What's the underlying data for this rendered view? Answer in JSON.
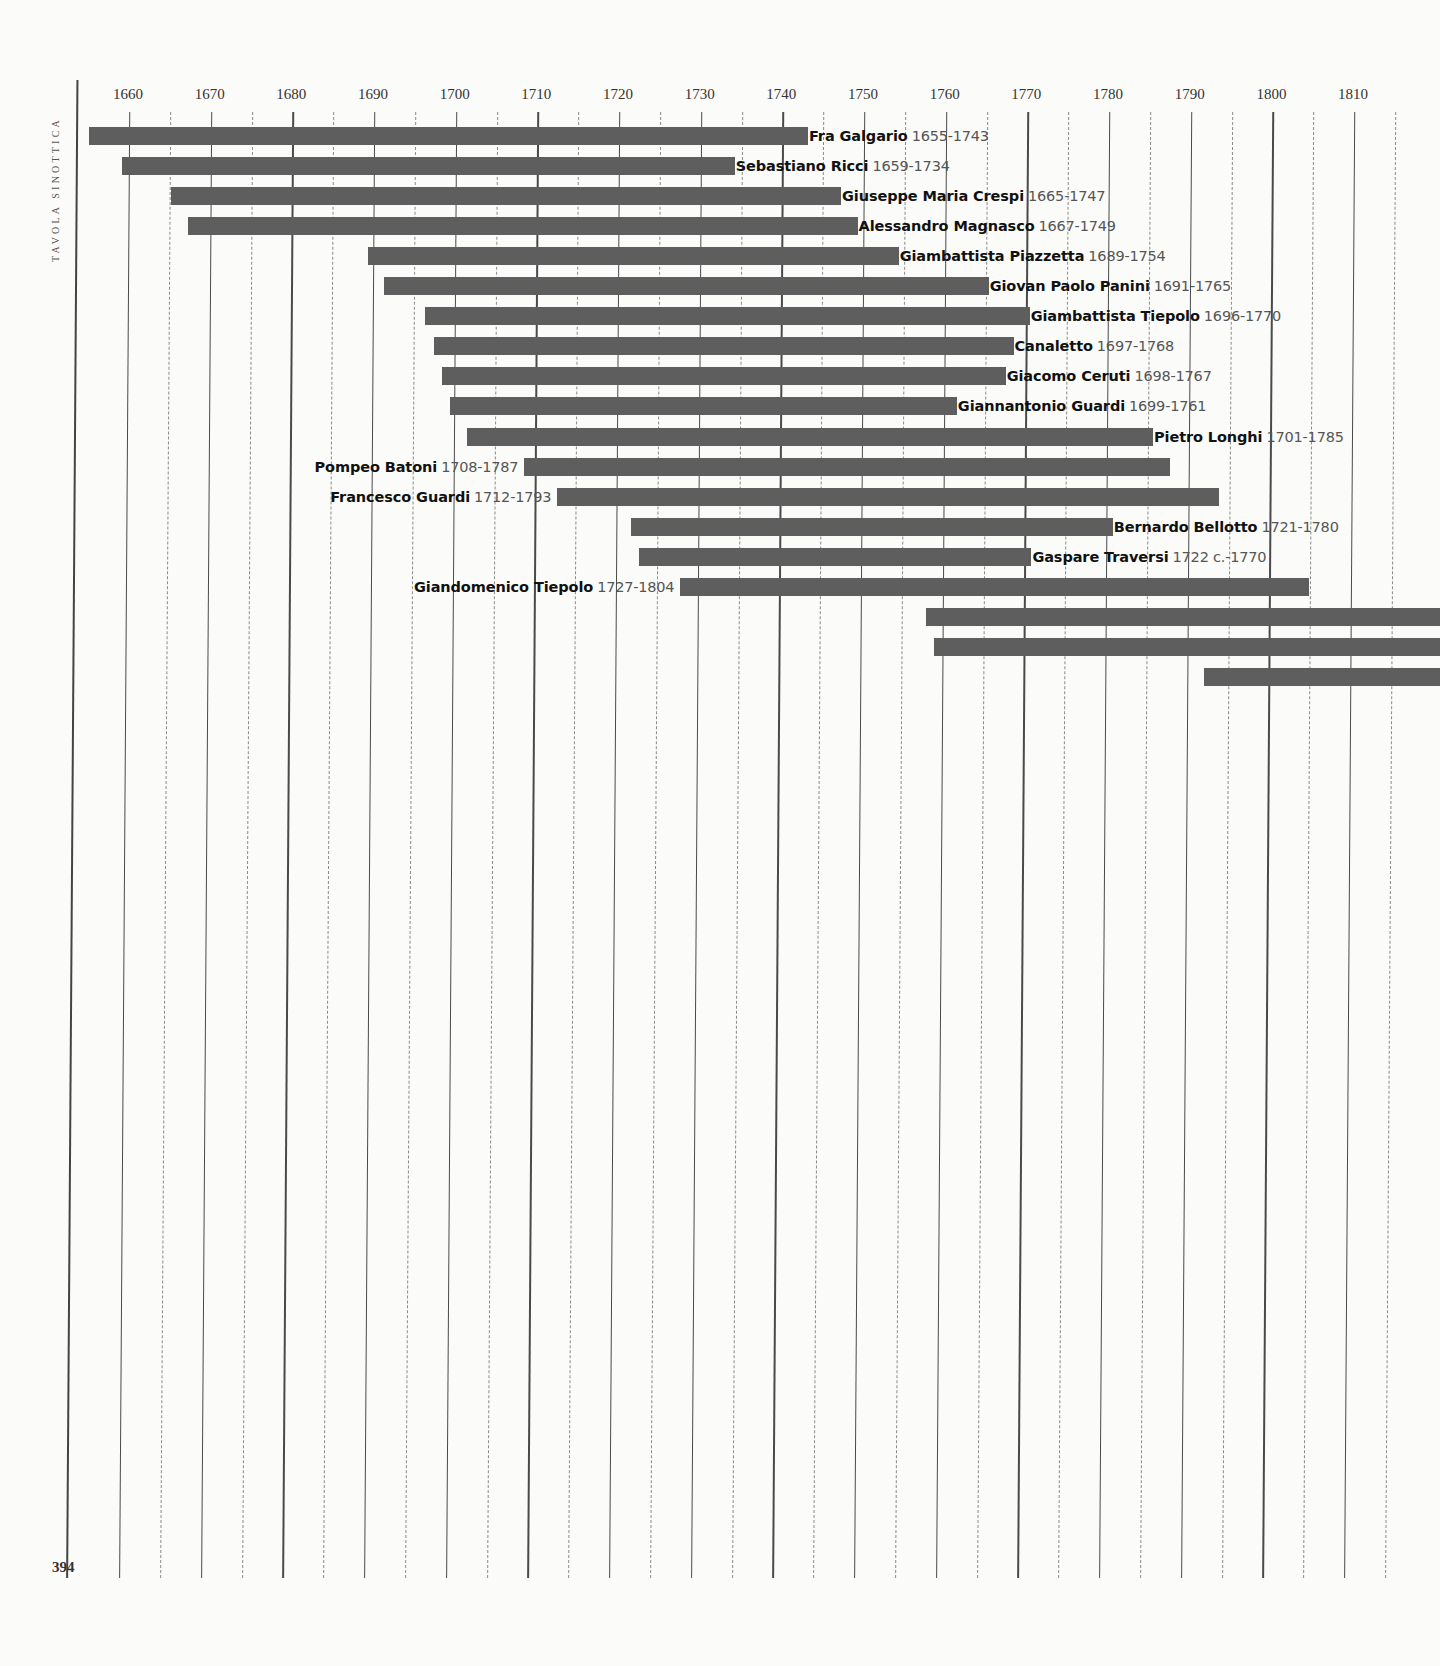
{
  "page": {
    "side_title": "Tavola sinottica",
    "page_number": "394"
  },
  "colors": {
    "bar": "#5e5e5e",
    "grid_solid": "#4a4a4a",
    "grid_dashed": "#8a8a8a",
    "background": "#fbfbf9"
  },
  "axis": {
    "ticks": [
      "1660",
      "1670",
      "1680",
      "1690",
      "1700",
      "1710",
      "1720",
      "1730",
      "1740",
      "1750",
      "1760",
      "1770",
      "1780",
      "1790",
      "1800",
      "1810"
    ]
  },
  "chart_data": {
    "type": "bar",
    "orientation": "horizontal-timeline",
    "title": "Tavola sinottica",
    "xlabel": "",
    "ylabel": "",
    "xlim": [
      1650,
      1818
    ],
    "grid": "solid lines every 10 years, dashed lines at mid-decades",
    "x_ticks": [
      1660,
      1670,
      1680,
      1690,
      1700,
      1710,
      1720,
      1730,
      1740,
      1750,
      1760,
      1770,
      1780,
      1790,
      1800,
      1810
    ],
    "series": [
      {
        "name": "Fra Galgario",
        "years_label": "1655-1743",
        "start": 1655,
        "end": 1743,
        "label_side": "right"
      },
      {
        "name": "Sebastiano Ricci",
        "years_label": "1659-1734",
        "start": 1659,
        "end": 1734,
        "label_side": "right"
      },
      {
        "name": "Giuseppe Maria Crespi",
        "years_label": "1665-1747",
        "start": 1665,
        "end": 1747,
        "label_side": "right"
      },
      {
        "name": "Alessandro Magnasco",
        "years_label": "1667-1749",
        "start": 1667,
        "end": 1749,
        "label_side": "right"
      },
      {
        "name": "Giambattista Piazzetta",
        "years_label": "1689-1754",
        "start": 1689,
        "end": 1754,
        "label_side": "right"
      },
      {
        "name": "Giovan Paolo Panini",
        "years_label": "1691-1765",
        "start": 1691,
        "end": 1765,
        "label_side": "right"
      },
      {
        "name": "Giambattista Tiepolo",
        "years_label": "1696-1770",
        "start": 1696,
        "end": 1770,
        "label_side": "right"
      },
      {
        "name": "Canaletto",
        "years_label": "1697-1768",
        "start": 1697,
        "end": 1768,
        "label_side": "right"
      },
      {
        "name": "Giacomo Ceruti",
        "years_label": "1698-1767",
        "start": 1698,
        "end": 1767,
        "label_side": "right"
      },
      {
        "name": "Giannantonio Guardi",
        "years_label": "1699-1761",
        "start": 1699,
        "end": 1761,
        "label_side": "right"
      },
      {
        "name": "Pietro Longhi",
        "years_label": "1701-1785",
        "start": 1701,
        "end": 1785,
        "label_side": "right"
      },
      {
        "name": "Pompeo Batoni",
        "years_label": "1708-1787",
        "start": 1708,
        "end": 1787,
        "label_side": "left"
      },
      {
        "name": "Francesco Guardi",
        "years_label": "1712-1793",
        "start": 1712,
        "end": 1793,
        "label_side": "left"
      },
      {
        "name": "Bernardo Bellotto",
        "years_label": "1721-1780",
        "start": 1721,
        "end": 1780,
        "label_side": "right"
      },
      {
        "name": "Gaspare Traversi",
        "years_label": "1722 c.-1770",
        "start": 1722,
        "end": 1770,
        "label_side": "right"
      },
      {
        "name": "Giandomenico Tiepolo",
        "years_label": "1727-1804",
        "start": 1727,
        "end": 1804,
        "label_side": "left"
      },
      {
        "name": "",
        "years_label": "",
        "start": 1757,
        "end": null,
        "label_side": "none",
        "note": "continues beyond page edge"
      },
      {
        "name": "",
        "years_label": "",
        "start": 1758,
        "end": null,
        "label_side": "none",
        "note": "continues beyond page edge"
      },
      {
        "name": "",
        "years_label": "",
        "start": 1791,
        "end": null,
        "label_side": "none",
        "note": "continues beyond page edge"
      }
    ]
  }
}
